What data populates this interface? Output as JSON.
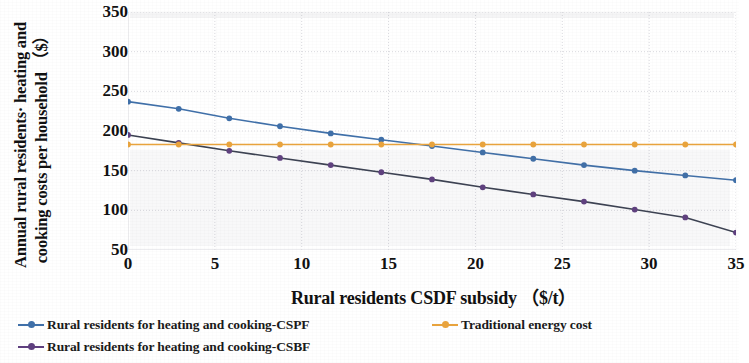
{
  "chart_data": {
    "type": "line",
    "title": "",
    "xlabel": "Rural residents CSDF subsidy （$/t）",
    "ylabel": "Annual rural residents· heating and cooking costs per household （$）",
    "xlim": [
      0,
      35
    ],
    "ylim": [
      50,
      350
    ],
    "xticks": [
      0,
      5,
      10,
      15,
      20,
      25,
      30,
      35
    ],
    "yticks": [
      50,
      100,
      150,
      200,
      250,
      300,
      350
    ],
    "grid": true,
    "legend_position": "bottom-left",
    "x": [
      0,
      2.92,
      5.83,
      8.75,
      11.67,
      14.58,
      17.5,
      20.42,
      23.33,
      26.25,
      29.17,
      32.08,
      35
    ],
    "series": [
      {
        "name": "Rural residents for heating and cooking-CSPF",
        "color": "#3f6fa8",
        "marker": "circle",
        "values": [
          237,
          228,
          216,
          206,
          197,
          189,
          181,
          173,
          165,
          157,
          150,
          144,
          138
        ]
      },
      {
        "name": "Rural residents for heating and cooking-CSBF",
        "color": "#5e3f7e",
        "line_color": "#3a4050",
        "marker": "circle",
        "values": [
          195,
          185,
          175,
          166,
          157,
          148,
          139,
          129,
          120,
          111,
          101,
          91,
          72
        ]
      },
      {
        "name": "Traditional energy cost",
        "color": "#e8a33d",
        "marker": "circle",
        "values": [
          183,
          183,
          183,
          183,
          183,
          183,
          183,
          183,
          183,
          183,
          183,
          183,
          183
        ]
      }
    ]
  },
  "legend": {
    "item1": "Rural residents for heating and cooking-CSPF",
    "item2": "Rural residents for heating and cooking-CSBF",
    "item3": "Traditional energy cost"
  },
  "colors": {
    "cspf": "#3f6fa8",
    "csbf": "#5e3f7e",
    "csbf_line": "#3a4050",
    "traditional": "#e8a33d",
    "grid": "#d9d9de",
    "axis": "#c8c8cf"
  }
}
